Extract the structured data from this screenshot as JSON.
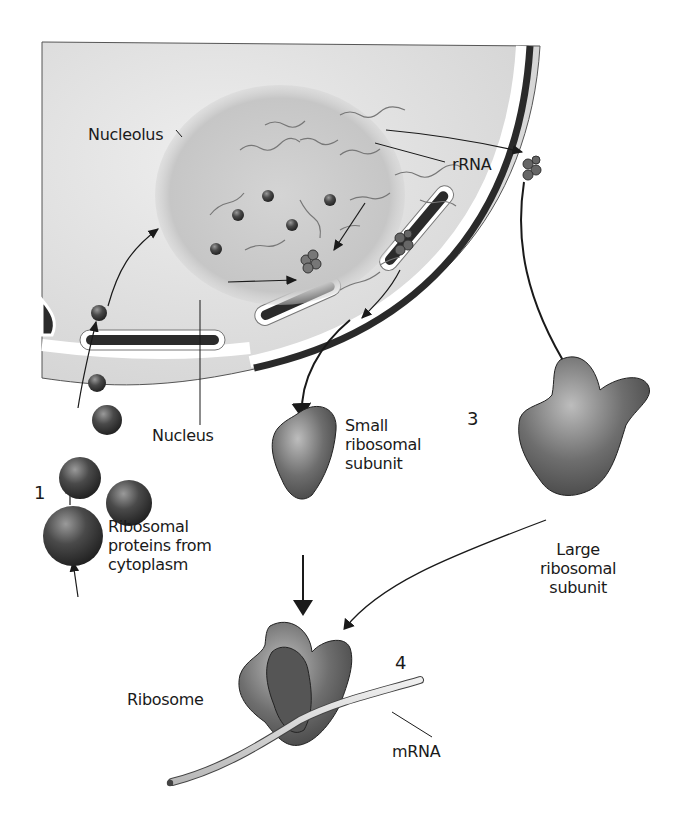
{
  "figure": {
    "colors": {
      "background": "#ffffff",
      "nucleoplasm": "#dcdcdc",
      "nucleolus": "#c8c8c8",
      "envelope_dark": "#2a2a2a",
      "protein": "#4a4a4a",
      "subunit": "#6a6a6a",
      "mrna": "#d8d8d8",
      "ink": "#1a1a1a"
    }
  },
  "labels": {
    "nucleolus": "Nucleolus",
    "rrna": "rRNA",
    "nucleus": "Nucleus",
    "ribosomal_proteins": "Ribosomal\nproteins from\ncytoplasm",
    "small_subunit": "Small\nribosomal\nsubunit",
    "large_subunit": "Large\nribosomal\nsubunit",
    "ribosome": "Ribosome",
    "mrna": "mRNA"
  },
  "steps": {
    "step1": "1",
    "step3": "3",
    "step4": "4"
  }
}
